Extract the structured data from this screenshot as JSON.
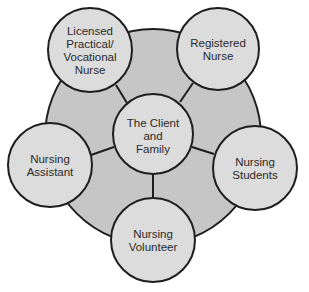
{
  "diagram": {
    "type": "hub-and-spoke",
    "colors": {
      "background": "#ffffff",
      "outer_ring_fill": "#c6c6c6",
      "node_fill": "#dcdcdc",
      "stroke": "#1e1e1e",
      "text": "#2a2a2a"
    },
    "outer_ring": {
      "cx": 153,
      "cy": 137,
      "r": 108
    },
    "center": {
      "id": "client-family",
      "label": "The Client\nand\nFamily",
      "cx": 153,
      "cy": 134,
      "r": 40
    },
    "nodes": [
      {
        "id": "lpn",
        "label": "Licensed\nPractical/\nVocational\nNurse",
        "cx": 90,
        "cy": 50,
        "r": 42
      },
      {
        "id": "rn",
        "label": "Registered\nNurse",
        "cx": 218,
        "cy": 49,
        "r": 41
      },
      {
        "id": "nursing-students",
        "label": "Nursing\nStudents",
        "cx": 255,
        "cy": 168,
        "r": 42
      },
      {
        "id": "nursing-volunteer",
        "label": "Nursing\nVolunteer",
        "cx": 153,
        "cy": 240,
        "r": 42
      },
      {
        "id": "nursing-assistant",
        "label": "Nursing\nAssistant",
        "cx": 50,
        "cy": 165,
        "r": 42
      }
    ],
    "spokes": [
      {
        "from": "client-family",
        "to": "lpn",
        "x1": 127,
        "y1": 103,
        "x2": 116,
        "y2": 85
      },
      {
        "from": "client-family",
        "to": "rn",
        "x1": 180,
        "y1": 102,
        "x2": 193,
        "y2": 83
      },
      {
        "from": "client-family",
        "to": "nursing-students",
        "x1": 192,
        "y1": 147,
        "x2": 214,
        "y2": 154
      },
      {
        "from": "client-family",
        "to": "nursing-volunteer",
        "x1": 153,
        "y1": 174,
        "x2": 153,
        "y2": 198
      },
      {
        "from": "client-family",
        "to": "nursing-assistant",
        "x1": 114,
        "y1": 147,
        "x2": 91,
        "y2": 155
      }
    ]
  }
}
